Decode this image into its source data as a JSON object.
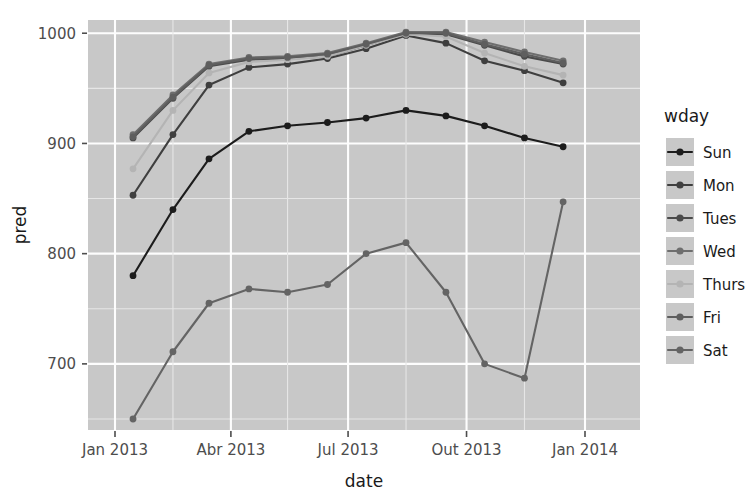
{
  "chart_data": {
    "type": "line",
    "title": "",
    "xlabel": "date",
    "ylabel": "pred",
    "legend_title": "wday",
    "legend_position": "right",
    "grid": true,
    "panel_background": "#c8c8c8",
    "gridline_color": "#ffffff",
    "xlim": [
      "2013-01-01",
      "2014-01-01"
    ],
    "ylim": [
      640,
      1012
    ],
    "y_ticks": [
      700,
      800,
      900,
      1000
    ],
    "y_tick_labels": [
      "700",
      "800",
      "900",
      "1000"
    ],
    "x_ticks": [
      "2013-01-01",
      "2013-04-01",
      "2013-07-01",
      "2013-10-01",
      "2014-01-01"
    ],
    "x_tick_labels": [
      "Jan 2013",
      "Abr 2013",
      "Jul 2013",
      "Out 2013",
      "Jan 2014"
    ],
    "x": [
      "2013-01-15",
      "2013-02-15",
      "2013-03-15",
      "2013-04-15",
      "2013-05-15",
      "2013-06-15",
      "2013-07-15",
      "2013-08-15",
      "2013-09-15",
      "2013-10-15",
      "2013-11-15",
      "2013-12-15"
    ],
    "series": [
      {
        "name": "Sun",
        "color": "#1c1c1c",
        "values": [
          780,
          840,
          886,
          911,
          916,
          919,
          923,
          930,
          925,
          916,
          905,
          897
        ]
      },
      {
        "name": "Mon",
        "color": "#3f3f3f",
        "values": [
          853,
          908,
          953,
          969,
          972,
          977,
          986,
          998,
          991,
          975,
          966,
          955
        ]
      },
      {
        "name": "Tues",
        "color": "#4a4a4a",
        "values": [
          905,
          941,
          970,
          976,
          977,
          979,
          989,
          1000,
          999,
          989,
          979,
          972
        ]
      },
      {
        "name": "Wed",
        "color": "#6e6e6e",
        "values": [
          908,
          944,
          972,
          978,
          979,
          982,
          991,
          1001,
          1001,
          992,
          983,
          975
        ]
      },
      {
        "name": "Thurs",
        "color": "#b4b4b4",
        "values": [
          877,
          930,
          964,
          974,
          976,
          979,
          989,
          999,
          997,
          982,
          970,
          962
        ]
      },
      {
        "name": "Fri",
        "color": "#5e5e5e",
        "values": [
          906,
          942,
          971,
          977,
          978,
          981,
          990,
          1000,
          1000,
          990,
          981,
          973
        ]
      },
      {
        "name": "Sat",
        "color": "#646464",
        "values": [
          650,
          711,
          755,
          768,
          765,
          772,
          800,
          810,
          765,
          700,
          687,
          750
        ]
      }
    ],
    "last_point_sat": 847
  },
  "axes": {
    "y_label": "pred",
    "x_label": "date"
  },
  "legend": {
    "title": "wday",
    "items": [
      {
        "label": "Sun",
        "color": "#1c1c1c"
      },
      {
        "label": "Mon",
        "color": "#3f3f3f"
      },
      {
        "label": "Tues",
        "color": "#4a4a4a"
      },
      {
        "label": "Wed",
        "color": "#6e6e6e"
      },
      {
        "label": "Thurs",
        "color": "#b4b4b4"
      },
      {
        "label": "Fri",
        "color": "#5e5e5e"
      },
      {
        "label": "Sat",
        "color": "#646464"
      }
    ]
  }
}
